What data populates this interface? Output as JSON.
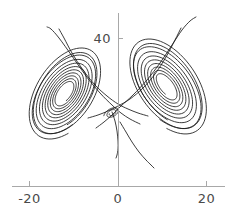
{
  "chart_data": {
    "type": "line",
    "title": "",
    "subtitle": "",
    "xlabel": "",
    "ylabel": "",
    "grid": false,
    "legend": null,
    "xlim": [
      -25,
      24
    ],
    "ylim": [
      -6,
      52
    ],
    "xticks": [
      -20,
      0,
      20
    ],
    "xticklabels": [
      "-20",
      "0",
      "20"
    ],
    "yticks": [
      40
    ],
    "yticklabels": [
      "40"
    ],
    "axis_color": "#a8a8a8",
    "curve_color": "#1a1a1a",
    "background_color": "#ffffff",
    "pixel_axes": {
      "x_axis_y": 186,
      "x_axis_x0": 12,
      "x_axis_x1": 225,
      "y_axis_x": 118,
      "y_axis_y0": 13,
      "y_axis_y1": 186,
      "tick_len": 5,
      "px_per_unit_x": 4.425,
      "px_per_unit_y": 3.7,
      "origin_px": [
        118,
        186
      ]
    },
    "series": [
      {
        "name": "left-wing-spiral",
        "kind": "spiral",
        "center": [
          65,
          93
        ],
        "rotation_deg": -56,
        "radius_a_start": 47,
        "radius_a_end": 12,
        "radius_b_start": 27,
        "radius_b_end": 6,
        "turns": 9,
        "start_angle_deg": 118,
        "direction": 1
      },
      {
        "name": "right-wing-spiral",
        "kind": "spiral",
        "center": [
          166,
          86
        ],
        "rotation_deg": 54,
        "radius_a_start": 50,
        "radius_a_end": 13,
        "radius_b_start": 28,
        "radius_b_end": 6,
        "turns": 8,
        "start_angle_deg": 62,
        "direction": -1
      },
      {
        "name": "left-wing-outer-lobe",
        "kind": "spiral",
        "center": [
          66,
          92
        ],
        "rotation_deg": -58,
        "radius_a_start": 53,
        "radius_a_end": 42,
        "radius_b_start": 31,
        "radius_b_end": 24,
        "turns": 2,
        "start_angle_deg": 130,
        "direction": 1
      },
      {
        "name": "right-wing-outer-lobe",
        "kind": "spiral",
        "center": [
          167,
          85
        ],
        "rotation_deg": 56,
        "radius_a_start": 56,
        "radius_a_end": 45,
        "radius_b_start": 32,
        "radius_b_end": 25,
        "turns": 2,
        "start_angle_deg": 50,
        "direction": -1
      },
      {
        "name": "crossover-left-to-right-upper",
        "kind": "path",
        "points": [
          [
            96,
            128
          ],
          [
            104,
            122
          ],
          [
            112,
            115
          ],
          [
            121,
            106
          ],
          [
            133,
            95
          ],
          [
            147,
            80
          ],
          [
            160,
            63
          ],
          [
            172,
            45
          ],
          [
            182,
            30
          ],
          [
            190,
            21
          ],
          [
            196,
            17
          ]
        ]
      },
      {
        "name": "crossover-right-to-left-upper",
        "kind": "path",
        "points": [
          [
            140,
            124
          ],
          [
            130,
            119
          ],
          [
            121,
            113
          ],
          [
            112,
            105
          ],
          [
            100,
            93
          ],
          [
            86,
            76
          ],
          [
            72,
            56
          ],
          [
            59,
            38
          ],
          [
            51,
            29
          ],
          [
            47,
            27
          ]
        ]
      },
      {
        "name": "crossover-mid-band-a",
        "kind": "path",
        "points": [
          [
            88,
            118
          ],
          [
            98,
            115
          ],
          [
            108,
            111
          ],
          [
            118,
            106
          ],
          [
            130,
            99
          ],
          [
            143,
            88
          ],
          [
            155,
            74
          ],
          [
            166,
            57
          ],
          [
            175,
            40
          ],
          [
            181,
            28
          ]
        ]
      },
      {
        "name": "crossover-mid-band-b",
        "kind": "path",
        "points": [
          [
            148,
            116
          ],
          [
            138,
            113
          ],
          [
            128,
            109
          ],
          [
            118,
            104
          ],
          [
            107,
            96
          ],
          [
            95,
            85
          ],
          [
            83,
            70
          ],
          [
            72,
            53
          ],
          [
            64,
            38
          ],
          [
            59,
            29
          ]
        ]
      },
      {
        "name": "tail-descending",
        "kind": "path",
        "points": [
          [
            112,
            112
          ],
          [
            115,
            121
          ],
          [
            117,
            131
          ],
          [
            118,
            141
          ],
          [
            118,
            149
          ],
          [
            117,
            155
          ],
          [
            116,
            158
          ]
        ]
      },
      {
        "name": "tail-lower-right",
        "kind": "path",
        "points": [
          [
            120,
            122
          ],
          [
            126,
            132
          ],
          [
            132,
            142
          ],
          [
            139,
            152
          ],
          [
            146,
            160
          ],
          [
            151,
            165
          ],
          [
            154,
            168
          ]
        ]
      },
      {
        "name": "inner-knot-left",
        "kind": "spiral",
        "center": [
          112,
          113
        ],
        "rotation_deg": -30,
        "radius_a_start": 9,
        "radius_a_end": 3,
        "radius_b_start": 5,
        "radius_b_end": 2,
        "turns": 2,
        "start_angle_deg": 200,
        "direction": 1
      }
    ]
  },
  "ticks": {
    "x": [
      {
        "label": "-20",
        "value": -20
      },
      {
        "label": "0",
        "value": 0
      },
      {
        "label": "20",
        "value": 20
      }
    ],
    "y": [
      {
        "label": "40",
        "value": 40
      }
    ]
  }
}
